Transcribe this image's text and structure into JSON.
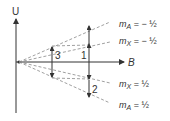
{
  "diagram": {
    "colors": {
      "ink": "#333333",
      "dash": "#777777",
      "background": "#ffffff"
    },
    "axes": {
      "vertical_label": "U",
      "horizontal_label": "B"
    },
    "transitions": [
      {
        "id": "3",
        "label": "3"
      },
      {
        "id": "1",
        "label": "1"
      },
      {
        "id": "2",
        "label": "2"
      }
    ],
    "levels": [
      {
        "m_symbol": "m",
        "sub": "A",
        "eq": " = − ½"
      },
      {
        "m_symbol": "m",
        "sub": "X",
        "eq": " = − ½"
      },
      {
        "m_symbol": "m",
        "sub": "X",
        "eq": " = ½"
      },
      {
        "m_symbol": "m",
        "sub": "A",
        "eq": " = ½"
      }
    ]
  }
}
